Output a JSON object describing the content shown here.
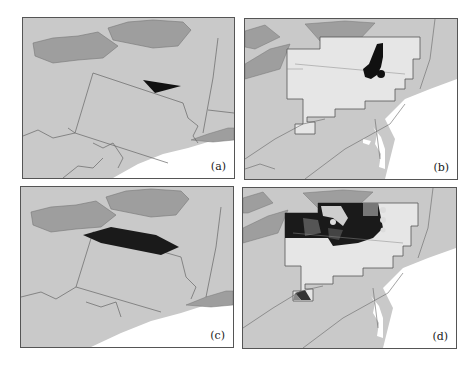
{
  "figure": {
    "panels": [
      {
        "id": "a",
        "label": "(a)",
        "feature": "small dark wedge-shaped region over Pennsylvania"
      },
      {
        "id": "b",
        "label": "(b)",
        "feature": "light gridded domain with dark plume in northeast Pennsylvania"
      },
      {
        "id": "c",
        "label": "(c)",
        "feature": "large dark elongated band across Pennsylvania"
      },
      {
        "id": "d",
        "label": "(d)",
        "feature": "light gridded domain with dark shading across northern area"
      }
    ]
  },
  "colors": {
    "land": "#c9c9c9",
    "lakes": "#9e9e9e",
    "ocean": "#ffffff",
    "boundary": "#666666",
    "domain": "#e6e6e6",
    "feature": "#111111"
  }
}
